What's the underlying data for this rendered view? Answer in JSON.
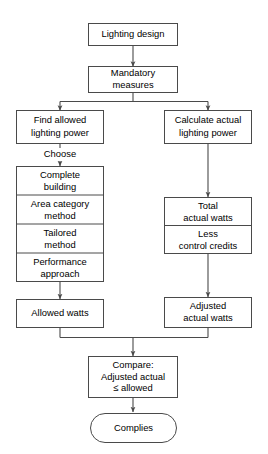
{
  "diagram": {
    "colors": {
      "background": "#ffffff",
      "stroke": "#4a4a4a",
      "text": "#000000",
      "fill": "#ffffff"
    },
    "nodes": {
      "lighting_design": {
        "line1": "Lighting design"
      },
      "mandatory_measures": {
        "line1": "Mandatory",
        "line2": "measures"
      },
      "find_allowed": {
        "line1": "Find allowed",
        "line2": "lighting power"
      },
      "calculate_actual": {
        "line1": "Calculate actual",
        "line2": "lighting power"
      },
      "complete_building": {
        "line1": "Complete",
        "line2": "building"
      },
      "area_category": {
        "line1": "Area category",
        "line2": "method"
      },
      "tailored": {
        "line1": "Tailored",
        "line2": "method"
      },
      "performance": {
        "line1": "Performance",
        "line2": "approach"
      },
      "total_actual_watts": {
        "line1": "Total",
        "line2": "actual watts"
      },
      "less_control_credits": {
        "line1": "Less",
        "line2": "control credits"
      },
      "allowed_watts": {
        "line1": "Allowed watts"
      },
      "adjusted_actual_watts": {
        "line1": "Adjusted",
        "line2": "actual watts"
      },
      "compare": {
        "line1": "Compare:",
        "line2": "Adjusted actual",
        "line3": "≤ allowed"
      },
      "complies": {
        "line1": "Complies"
      }
    },
    "edge_labels": {
      "choose": "Choose"
    },
    "icons": {
      "arrowhead": "arrow-down-icon"
    }
  }
}
